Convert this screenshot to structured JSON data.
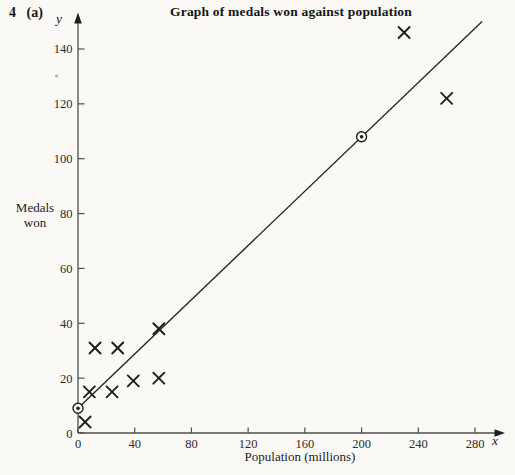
{
  "question_label": "4 (a)",
  "chart_data": {
    "type": "scatter",
    "title": "Graph of medals won against population",
    "xlabel": "Population (millions)",
    "ylabel": "Medals won",
    "ylabel_lines": [
      "Medals",
      "won"
    ],
    "x_axis_letter": "x",
    "y_axis_letter": "y",
    "x_ticks": [
      0,
      40,
      80,
      120,
      160,
      200,
      240,
      280
    ],
    "y_ticks": [
      0,
      20,
      40,
      60,
      80,
      100,
      120,
      140
    ],
    "xlim": [
      0,
      295
    ],
    "ylim": [
      0,
      152
    ],
    "grid": false,
    "legend": false,
    "marker": "x-cross",
    "points": [
      {
        "x": 5,
        "y": 4
      },
      {
        "x": 8,
        "y": 15
      },
      {
        "x": 12,
        "y": 31
      },
      {
        "x": 24,
        "y": 15
      },
      {
        "x": 28,
        "y": 31
      },
      {
        "x": 39,
        "y": 19
      },
      {
        "x": 57,
        "y": 38
      },
      {
        "x": 57,
        "y": 20
      },
      {
        "x": 230,
        "y": 146
      },
      {
        "x": 260,
        "y": 122
      }
    ],
    "circled_line_points": [
      {
        "x": 0,
        "y": 9
      },
      {
        "x": 200,
        "y": 108
      }
    ],
    "best_fit_line": {
      "x1": 0,
      "y1": 9,
      "x2": 285,
      "y2": 150
    },
    "colors": {
      "paper": "#faf9f6",
      "ink": "#1e1e1e",
      "axis": "#4d4d4d",
      "line": "#262626"
    }
  }
}
